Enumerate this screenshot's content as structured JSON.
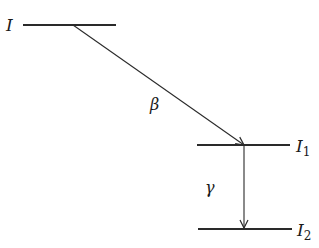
{
  "diagram": {
    "type": "decay-scheme",
    "levels": [
      {
        "id": "I",
        "label": "I",
        "subscript": ""
      },
      {
        "id": "I1",
        "label": "I",
        "subscript": "1"
      },
      {
        "id": "I2",
        "label": "I",
        "subscript": "2"
      }
    ],
    "transitions": [
      {
        "from": "I",
        "to": "I1",
        "label": "β"
      },
      {
        "from": "I1",
        "to": "I2",
        "label": "γ"
      }
    ]
  },
  "colors": {
    "line": "#2a2a2a",
    "text": "#1a1a1a",
    "background": "#ffffff"
  }
}
